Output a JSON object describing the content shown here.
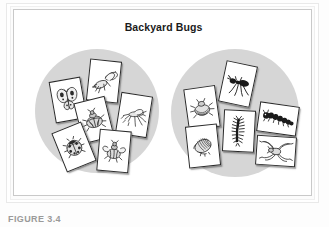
{
  "figure": {
    "title": "Backyard Bugs",
    "caption": "FIGURE 3.4",
    "frame_color": "#c9c9c9",
    "panel_color": "#ffffff",
    "mat_color": "#d6d6d6",
    "card_color": "#ffffff",
    "ink_color": "#2a2a2a"
  },
  "mats": [
    {
      "name": "left-sorting-circle",
      "label": "Insects group",
      "card_count": 6,
      "cards": [
        {
          "icon": "butterfly-icon",
          "label": "butterfly",
          "x": 38,
          "y": 69,
          "rot": -10
        },
        {
          "icon": "wasp-icon",
          "label": "wasp",
          "x": 74,
          "y": 50,
          "rot": 6
        },
        {
          "icon": "beetle-icon",
          "label": "beetle",
          "x": 64,
          "y": 89,
          "rot": -14
        },
        {
          "icon": "mosquito-icon",
          "label": "mosquito",
          "x": 104,
          "y": 84,
          "rot": 9
        },
        {
          "icon": "ladybug-icon",
          "label": "ladybug",
          "x": 44,
          "y": 116,
          "rot": -22
        },
        {
          "icon": "bee-icon",
          "label": "bee",
          "x": 84,
          "y": 120,
          "rot": 5
        }
      ]
    },
    {
      "name": "right-sorting-circle",
      "label": "Other bugs group",
      "card_count": 6,
      "cards": [
        {
          "icon": "ant-icon",
          "label": "ant",
          "x": 208,
          "y": 53,
          "rot": 12
        },
        {
          "icon": "tick-icon",
          "label": "tick",
          "x": 172,
          "y": 77,
          "rot": -8
        },
        {
          "icon": "caterpillar-icon",
          "label": "caterpillar",
          "x": 244,
          "y": 94,
          "rot": 8
        },
        {
          "icon": "pillbug-icon",
          "label": "pillbug",
          "x": 173,
          "y": 115,
          "rot": -6
        },
        {
          "icon": "centipede-icon",
          "label": "centipede",
          "x": 209,
          "y": 100,
          "rot": 3
        },
        {
          "icon": "spider-icon",
          "label": "spider",
          "x": 242,
          "y": 126,
          "rot": 4
        }
      ]
    }
  ]
}
